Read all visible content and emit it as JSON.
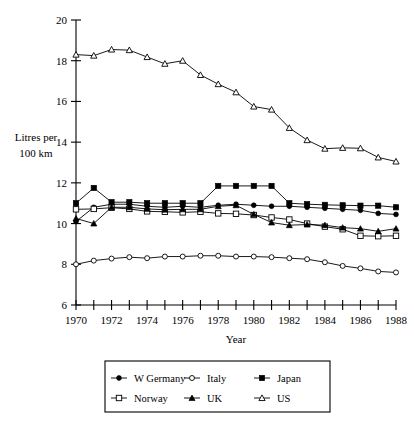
{
  "chart_data": {
    "type": "line",
    "title": "",
    "xlabel": "Year",
    "ylabel": "Litres per 100 km",
    "ylabel_line1": "Litres per",
    "ylabel_line2": "100 km",
    "xlim": [
      1970,
      1988
    ],
    "ylim": [
      6,
      20
    ],
    "ytick_step": 2,
    "xtick_step": 1,
    "xlabel_step": 2,
    "grid": false,
    "legend_position": "bottom",
    "x": [
      1970,
      1971,
      1972,
      1973,
      1974,
      1975,
      1976,
      1977,
      1978,
      1979,
      1980,
      1981,
      1982,
      1983,
      1984,
      1985,
      1986,
      1987,
      1988
    ],
    "yticks": [
      6,
      8,
      10,
      12,
      14,
      16,
      18,
      20
    ],
    "xticks": [
      1970,
      1971,
      1972,
      1973,
      1974,
      1975,
      1976,
      1977,
      1978,
      1979,
      1980,
      1981,
      1982,
      1983,
      1984,
      1985,
      1986,
      1987,
      1988
    ],
    "xtick_labels": [
      "1970",
      "",
      "1972",
      "",
      "1974",
      "",
      "1976",
      "",
      "1978",
      "",
      "1980",
      "",
      "1982",
      "",
      "1984",
      "",
      "1986",
      "",
      "1988"
    ],
    "ytick_labels": [
      "6",
      "8",
      "10",
      "12",
      "14",
      "16",
      "18",
      "20"
    ],
    "series": [
      {
        "name": "W Germany",
        "marker": "filled-circle",
        "values": [
          10.1,
          10.8,
          10.95,
          10.95,
          10.85,
          10.8,
          10.85,
          10.8,
          10.9,
          10.95,
          10.9,
          10.85,
          10.85,
          10.8,
          10.75,
          10.7,
          10.65,
          10.5,
          10.45
        ]
      },
      {
        "name": "Italy",
        "marker": "open-circle",
        "values": [
          8.0,
          8.18,
          8.28,
          8.35,
          8.3,
          8.38,
          8.38,
          8.42,
          8.42,
          8.38,
          8.38,
          8.35,
          8.3,
          8.25,
          8.1,
          7.92,
          7.8,
          7.65,
          7.6
        ]
      },
      {
        "name": "Japan",
        "marker": "filled-square",
        "values": [
          11.0,
          11.75,
          11.05,
          11.05,
          11.0,
          11.0,
          11.0,
          11.0,
          11.85,
          11.85,
          11.85,
          11.85,
          11.0,
          10.95,
          10.92,
          10.9,
          10.88,
          10.88,
          10.8
        ]
      },
      {
        "name": "Norway",
        "marker": "open-square",
        "values": [
          10.7,
          10.72,
          10.78,
          10.72,
          10.6,
          10.58,
          10.55,
          10.58,
          10.5,
          10.48,
          10.42,
          10.3,
          10.2,
          10.0,
          9.85,
          9.72,
          9.4,
          9.38,
          9.4
        ]
      },
      {
        "name": "UK",
        "marker": "filled-triangle",
        "values": [
          10.25,
          10.0,
          10.8,
          10.8,
          10.72,
          10.68,
          10.7,
          10.7,
          10.85,
          10.9,
          10.45,
          10.05,
          9.92,
          9.95,
          9.92,
          9.8,
          9.75,
          9.62,
          9.75
        ]
      },
      {
        "name": "US",
        "marker": "open-triangle",
        "values": [
          18.3,
          18.25,
          18.55,
          18.52,
          18.18,
          17.85,
          18.0,
          17.3,
          16.85,
          16.45,
          15.75,
          15.6,
          14.7,
          14.1,
          13.68,
          13.72,
          13.7,
          13.25,
          13.05
        ]
      }
    ]
  },
  "legend": {
    "entries": [
      {
        "label": "W Germany",
        "marker": "filled-circle"
      },
      {
        "label": "Italy",
        "marker": "open-circle"
      },
      {
        "label": "Japan",
        "marker": "filled-square"
      },
      {
        "label": "Norway",
        "marker": "open-square"
      },
      {
        "label": "UK",
        "marker": "filled-triangle"
      },
      {
        "label": "US",
        "marker": "open-triangle"
      }
    ]
  },
  "colors": {
    "ink": "#000000",
    "background": "#ffffff"
  }
}
